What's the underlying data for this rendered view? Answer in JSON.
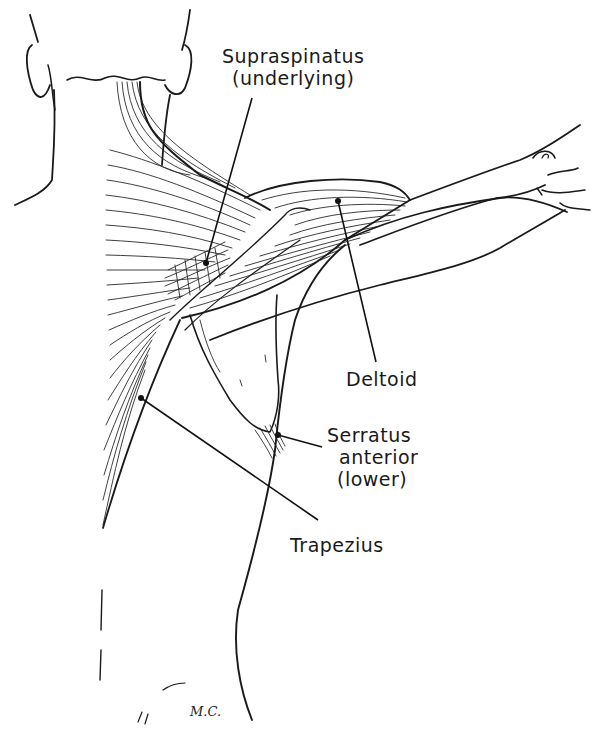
{
  "figure": {
    "labels": [
      {
        "id": "supraspinatus",
        "lines": [
          "Supraspinatus",
          "(underlying)"
        ],
        "x": 222,
        "y": 45,
        "pointer": [
          206,
          263
        ]
      },
      {
        "id": "deltoid",
        "lines": [
          "Deltoid"
        ],
        "x": 346,
        "y": 368,
        "pointer": [
          338,
          201
        ]
      },
      {
        "id": "serratus_anterior",
        "lines": [
          "Serratus",
          "anterior",
          "(lower)"
        ],
        "x": 327,
        "y": 424,
        "pointer": [
          278,
          435
        ]
      },
      {
        "id": "trapezius",
        "lines": [
          "Trapezius"
        ],
        "x": 290,
        "y": 534,
        "pointer": [
          141,
          398
        ]
      }
    ],
    "signature": "M.C.",
    "colors": {
      "ink": "#1a1a1a",
      "background": "#ffffff"
    }
  }
}
